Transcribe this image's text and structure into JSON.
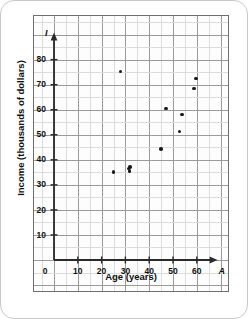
{
  "chart_data": {
    "type": "scatter",
    "title": "",
    "xlabel": "Age (years)",
    "ylabel": "Income (thousands of dollars)",
    "x_axis_name": "A",
    "y_axis_name": "I",
    "origin_label": "0",
    "xlim": [
      0,
      70
    ],
    "ylim": [
      0,
      88
    ],
    "xticks": [
      10,
      20,
      30,
      40,
      50,
      60
    ],
    "yticks": [
      10,
      20,
      30,
      40,
      50,
      60,
      70,
      80
    ],
    "xtick_labels": [
      "10",
      "20",
      "30",
      "40",
      "50",
      "60"
    ],
    "ytick_labels": [
      "10",
      "20",
      "30",
      "40",
      "50",
      "60",
      "70",
      "80"
    ],
    "grid": true,
    "grid_major_step": 10,
    "grid_minor_step": 5,
    "legend": false,
    "point_color": "#1a1a1a",
    "axis_color": "#2a2a2a",
    "grid_major_color": "#9a9a9a",
    "grid_minor_color": "#dcdcdc",
    "points": [
      {
        "x": 25,
        "y": 35.2
      },
      {
        "x": 28,
        "y": 75.3
      },
      {
        "x": 31.3,
        "y": 36.6
      },
      {
        "x": 31.8,
        "y": 35.6
      },
      {
        "x": 32,
        "y": 37.1
      },
      {
        "x": 45,
        "y": 44.4
      },
      {
        "x": 47,
        "y": 60.4
      },
      {
        "x": 52.8,
        "y": 51.3
      },
      {
        "x": 53.8,
        "y": 58.1
      },
      {
        "x": 58.8,
        "y": 68.5
      },
      {
        "x": 59.6,
        "y": 72.5
      }
    ]
  }
}
